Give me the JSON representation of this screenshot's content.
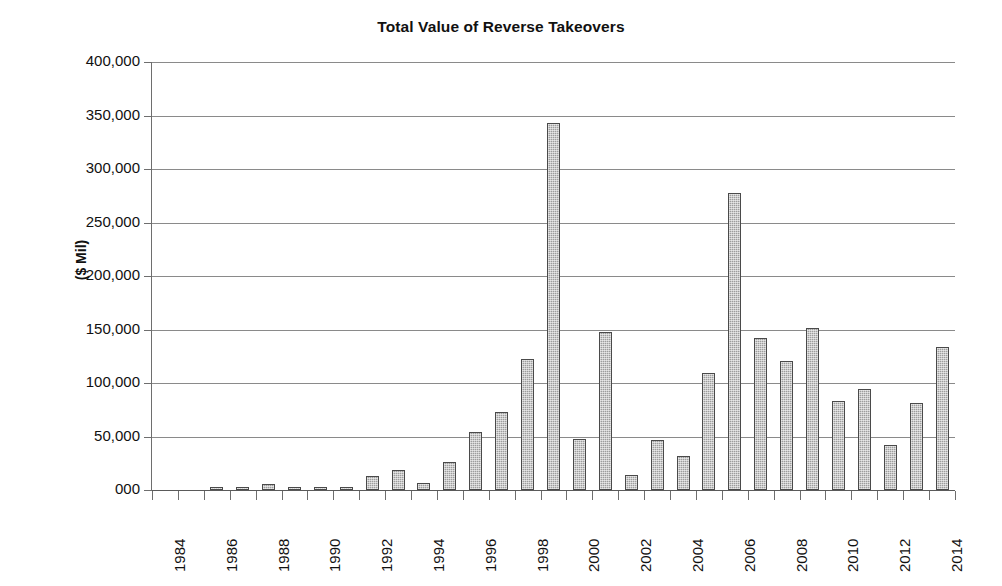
{
  "chart_data": {
    "type": "bar",
    "title": "Total Value of Reverse Takeovers",
    "xlabel": "",
    "ylabel": "($ Mil)",
    "ylim": [
      0,
      400000
    ],
    "ytick_labels": [
      "400,000",
      "350,000",
      "300,000",
      "250,000",
      "200,000",
      "150,000",
      "100,000",
      "50,000",
      "000"
    ],
    "ytick_values": [
      400000,
      350000,
      300000,
      250000,
      200000,
      150000,
      100000,
      50000,
      0
    ],
    "grid": true,
    "legend": false,
    "xtick_labels": [
      "1984",
      "1986",
      "1988",
      "1990",
      "1992",
      "1994",
      "1996",
      "1998",
      "2000",
      "2002",
      "2004",
      "2006",
      "2008",
      "2010",
      "2012",
      "2014"
    ],
    "categories": [
      "1984",
      "1985",
      "1986",
      "1987",
      "1988",
      "1989",
      "1990",
      "1991",
      "1992",
      "1993",
      "1994",
      "1995",
      "1996",
      "1997",
      "1998",
      "1999",
      "2000",
      "2001",
      "2002",
      "2003",
      "2004",
      "2005",
      "2006",
      "2007",
      "2008",
      "2009",
      "2010",
      "2011",
      "2012",
      "2013",
      "2014"
    ],
    "values": [
      0,
      0,
      1200,
      1300,
      6000,
      1200,
      1100,
      1400,
      13000,
      18500,
      6500,
      26000,
      54000,
      73000,
      122000,
      343000,
      48000,
      148000,
      14500,
      47000,
      32000,
      109000,
      278000,
      142000,
      121000,
      151000,
      83000,
      94000,
      42000,
      81000,
      134000
    ],
    "bar_color": "#9d9d9d",
    "bar_edge_color": "#4a4a4a"
  }
}
